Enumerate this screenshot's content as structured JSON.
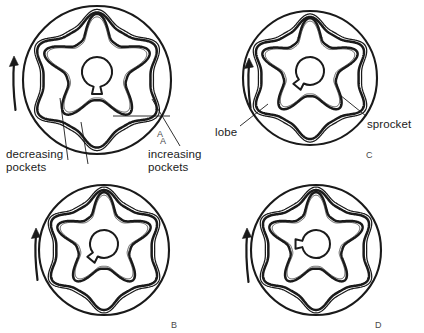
{
  "figure": {
    "type": "technical-diagram",
    "panel_count": 4,
    "background_color": "#ffffff",
    "line_color": "#1a1a1a"
  },
  "panels": [
    {
      "id": "A",
      "letter": "A",
      "letter_x": 160,
      "letter_y": 136,
      "housing": {
        "cx": 97,
        "cy": 80,
        "r": 74
      },
      "outer_rotor": {
        "cx": 97,
        "cy": 80,
        "r_outer": 62,
        "r_inner": 56,
        "lobes": 6,
        "phase_deg": -90
      },
      "inner_rotor": {
        "cx": 97,
        "cy": 69,
        "r_outer": 52,
        "lobes": 5,
        "phase_deg": -90
      },
      "bore": {
        "cx": 97,
        "cy": 72,
        "r": 15,
        "keyway": "bottom"
      },
      "arrow": {
        "x": 14,
        "y_top": 56,
        "y_bottom": 110
      }
    },
    {
      "id": "C",
      "letter": "C",
      "letter_x": 366,
      "letter_y": 150,
      "housing": {
        "cx": 310,
        "cy": 78,
        "r": 67
      },
      "outer_rotor": {
        "cx": 310,
        "cy": 78,
        "r_outer": 56,
        "r_inner": 51,
        "lobes": 6,
        "phase_deg": -90
      },
      "inner_rotor": {
        "cx": 310,
        "cy": 68,
        "r_outer": 47,
        "lobes": 5,
        "phase_deg": -90
      },
      "bore": {
        "cx": 310,
        "cy": 71,
        "r": 14,
        "keyway": "bottom-left"
      },
      "arrow": {
        "x": 249,
        "y_top": 58,
        "y_bottom": 108
      }
    },
    {
      "id": "B",
      "letter": "B",
      "letter_x": 171,
      "letter_y": 320,
      "housing": {
        "cx": 104,
        "cy": 250,
        "r": 65
      },
      "outer_rotor": {
        "cx": 104,
        "cy": 250,
        "r_outer": 55,
        "r_inner": 50,
        "lobes": 6,
        "phase_deg": -90
      },
      "inner_rotor": {
        "cx": 104,
        "cy": 241,
        "r_outer": 46,
        "lobes": 5,
        "phase_deg": -90
      },
      "bore": {
        "cx": 104,
        "cy": 244,
        "r": 14,
        "keyway": "bottom-left"
      },
      "arrow": {
        "x": 36,
        "y_top": 228,
        "y_bottom": 280
      }
    },
    {
      "id": "D",
      "letter": "D",
      "letter_x": 375,
      "letter_y": 320,
      "housing": {
        "cx": 316,
        "cy": 250,
        "r": 65
      },
      "outer_rotor": {
        "cx": 316,
        "cy": 250,
        "r_outer": 55,
        "r_inner": 50,
        "lobes": 6,
        "phase_deg": -90
      },
      "inner_rotor": {
        "cx": 316,
        "cy": 241,
        "r_outer": 46,
        "lobes": 5,
        "phase_deg": -90
      },
      "bore": {
        "cx": 316,
        "cy": 244,
        "r": 14,
        "keyway": "left"
      },
      "arrow": {
        "x": 247,
        "y_top": 228,
        "y_bottom": 282
      }
    }
  ],
  "annotations": [
    {
      "name": "decreasing-pockets",
      "text_line1": "decreasing",
      "text_line2": "pockets",
      "x": 6,
      "y": 148,
      "leaders": [
        {
          "x1": 68,
          "y1": 160,
          "x2": 60,
          "y2": 98
        },
        {
          "x1": 88,
          "y1": 164,
          "x2": 81,
          "y2": 122
        }
      ]
    },
    {
      "name": "increasing-pockets",
      "text_line1": "increasing",
      "text_line2": "pockets",
      "x": 148,
      "y": 148,
      "leaders": [
        {
          "x1": 180,
          "y1": 146,
          "x2": 152,
          "y2": 99
        },
        {
          "x1": 170,
          "y1": 116,
          "x2": 113,
          "y2": 116
        }
      ]
    },
    {
      "name": "label-a",
      "text_line1": "A",
      "text_line2": "",
      "x": 157,
      "y": 129,
      "leaders": []
    },
    {
      "name": "lobe",
      "text_line1": "lobe",
      "text_line2": "",
      "x": 215,
      "y": 126,
      "leaders": [
        {
          "x1": 240,
          "y1": 126,
          "x2": 268,
          "y2": 104
        }
      ]
    },
    {
      "name": "sprocket",
      "text_line1": "sprocket",
      "text_line2": "",
      "x": 367,
      "y": 118,
      "leaders": [
        {
          "x1": 366,
          "y1": 116,
          "x2": 340,
          "y2": 95
        }
      ]
    }
  ],
  "rotation": {
    "direction": "counterclockwise-upward",
    "arrow_glyph": "up-arrow"
  }
}
